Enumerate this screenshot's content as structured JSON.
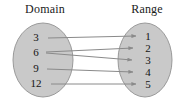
{
  "diagram": {
    "type": "mapping-diagram",
    "background_color": "#ffffff",
    "domain": {
      "title": "Domain",
      "ellipse": {
        "cx": 43,
        "cy": 60,
        "rx": 30,
        "ry": 37
      },
      "fill_color": "#c9c9c9",
      "stroke_color": "#9a9a9a",
      "elements": [
        {
          "label": "3",
          "x": 36,
          "y": 37
        },
        {
          "label": "6",
          "x": 36,
          "y": 52
        },
        {
          "label": "9",
          "x": 36,
          "y": 68
        },
        {
          "label": "12",
          "x": 36,
          "y": 83
        }
      ]
    },
    "range": {
      "title": "Range",
      "ellipse": {
        "cx": 145,
        "cy": 60,
        "rx": 27,
        "ry": 37
      },
      "fill_color": "#c9c9c9",
      "stroke_color": "#9a9a9a",
      "elements": [
        {
          "label": "1",
          "x": 148,
          "y": 36
        },
        {
          "label": "2",
          "x": 148,
          "y": 48
        },
        {
          "label": "3",
          "x": 148,
          "y": 60
        },
        {
          "label": "4",
          "x": 148,
          "y": 72
        },
        {
          "label": "5",
          "x": 148,
          "y": 84
        }
      ]
    },
    "arrow_color": "#8a8a8a",
    "mappings": [
      {
        "from": "3",
        "to": "1",
        "x1": 48,
        "y1": 38,
        "x2": 136,
        "y2": 36
      },
      {
        "from": "6",
        "to": "2",
        "x1": 46,
        "y1": 52,
        "x2": 133,
        "y2": 48
      },
      {
        "from": "6",
        "to": "3",
        "x1": 46,
        "y1": 53,
        "x2": 132,
        "y2": 60
      },
      {
        "from": "9",
        "to": "4",
        "x1": 47,
        "y1": 69,
        "x2": 133,
        "y2": 72
      },
      {
        "from": "12",
        "to": "5",
        "x1": 51,
        "y1": 84,
        "x2": 136,
        "y2": 84
      }
    ]
  }
}
